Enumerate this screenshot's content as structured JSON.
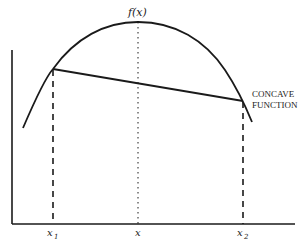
{
  "diagram": {
    "title_label": "f(x)",
    "annotation": {
      "line1": "CONCAVE",
      "line2": "FUNCTION"
    },
    "x_tick_labels": {
      "x1": "x",
      "x1_sub": "1",
      "x": "x",
      "x2": "x",
      "x2_sub": "2"
    },
    "colors": {
      "stroke": "#1a1a1a",
      "background": "#ffffff"
    }
  }
}
